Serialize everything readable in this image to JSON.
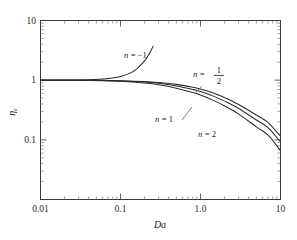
{
  "chart_data": {
    "type": "line",
    "title": "",
    "xlabel": "Da",
    "ylabel": "ηe",
    "ylabel_base": "η",
    "ylabel_sub": "e",
    "xscale": "log",
    "yscale": "log",
    "xlim": [
      0.01,
      10
    ],
    "ylim": [
      0.01,
      10
    ],
    "grid": false,
    "legend": "inline-annotations",
    "xticks": [
      0.01,
      0.1,
      1.0,
      10
    ],
    "xticklabels": [
      "0.01",
      "0.1",
      "1.0",
      "10"
    ],
    "yticks": [
      10,
      1,
      0.1
    ],
    "yticklabels": [
      "10",
      "1",
      "0.1"
    ],
    "series": [
      {
        "name": "n = -1",
        "label": "n = −1",
        "label_n": "n",
        "label_eq": "= −1",
        "x": [
          0.01,
          0.02,
          0.04,
          0.06,
          0.08,
          0.1,
          0.13,
          0.16,
          0.19,
          0.21,
          0.23,
          0.245,
          0.255
        ],
        "y": [
          1.0,
          1.005,
          1.02,
          1.05,
          1.09,
          1.15,
          1.3,
          1.55,
          1.95,
          2.3,
          2.8,
          3.3,
          3.7
        ]
      },
      {
        "name": "n = 1/2",
        "label": "n = 1/2",
        "label_n": "n",
        "label_eq": "=",
        "numerator": "1",
        "denominator": "2",
        "x": [
          0.01,
          0.03,
          0.06,
          0.1,
          0.2,
          0.3,
          0.5,
          0.8,
          1.0,
          1.5,
          2.0,
          3.0,
          5.0,
          7.0,
          10.0
        ],
        "y": [
          1.0,
          0.998,
          0.992,
          0.98,
          0.95,
          0.915,
          0.85,
          0.76,
          0.71,
          0.6,
          0.51,
          0.39,
          0.26,
          0.195,
          0.115
        ]
      },
      {
        "name": "n = 1",
        "label": "n = 1",
        "label_n": "n",
        "label_eq": "= 1",
        "x": [
          0.01,
          0.03,
          0.06,
          0.1,
          0.2,
          0.3,
          0.5,
          0.8,
          1.0,
          1.5,
          2.0,
          3.0,
          5.0,
          7.0,
          10.0
        ],
        "y": [
          1.0,
          0.997,
          0.988,
          0.972,
          0.93,
          0.885,
          0.8,
          0.7,
          0.645,
          0.53,
          0.445,
          0.335,
          0.215,
          0.16,
          0.092
        ]
      },
      {
        "name": "n = 2",
        "label": "n = 2",
        "label_n": "n",
        "label_eq": "= 2",
        "x": [
          0.01,
          0.03,
          0.06,
          0.1,
          0.2,
          0.3,
          0.5,
          0.8,
          1.0,
          1.5,
          2.0,
          3.0,
          5.0,
          7.0,
          10.0
        ],
        "y": [
          1.0,
          0.995,
          0.982,
          0.958,
          0.895,
          0.84,
          0.735,
          0.62,
          0.565,
          0.45,
          0.37,
          0.27,
          0.165,
          0.12,
          0.066
        ]
      }
    ],
    "annotations": [
      {
        "text": "n = −1",
        "x": 0.22,
        "y": 2.9
      },
      {
        "text": "n = 1/2",
        "x": 1.3,
        "y": 0.93
      },
      {
        "text": "n = 1",
        "x": 0.75,
        "y": 0.46
      },
      {
        "text": "n = 2",
        "x": 1.5,
        "y": 0.34
      }
    ],
    "colors": {
      "curve": "#2b2b2b",
      "frame": "#3a3a3a",
      "text": "#1a1a1a",
      "background": "#ffffff"
    }
  },
  "figure": {
    "background": "#ffffff"
  }
}
